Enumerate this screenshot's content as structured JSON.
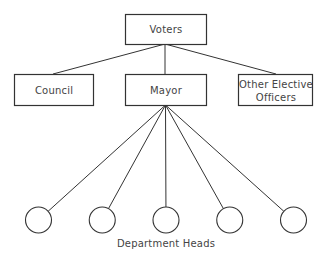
{
  "diagram": {
    "type": "org-chart",
    "nodes": {
      "voters": "Voters",
      "council": "Council",
      "mayor": "Mayor",
      "other_line1": "Other Elective",
      "other_line2": "Officers"
    },
    "department_heads_label": "Department Heads",
    "department_head_count": 5,
    "edges": [
      [
        "Voters",
        "Council"
      ],
      [
        "Voters",
        "Mayor"
      ],
      [
        "Voters",
        "Other Elective Officers"
      ],
      [
        "Mayor",
        "Department Head 1"
      ],
      [
        "Mayor",
        "Department Head 2"
      ],
      [
        "Mayor",
        "Department Head 3"
      ],
      [
        "Mayor",
        "Department Head 4"
      ],
      [
        "Mayor",
        "Department Head 5"
      ]
    ]
  }
}
